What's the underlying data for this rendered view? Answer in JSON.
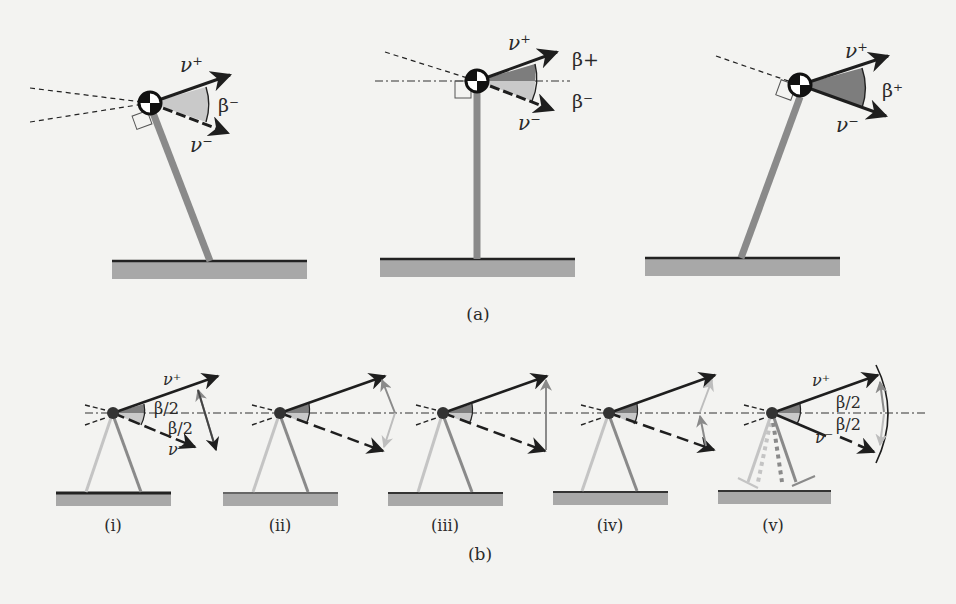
{
  "figure": {
    "panel_a": {
      "caption": "(a)",
      "subfigures": [
        {
          "id": "a-left",
          "v_plus": "ν⁺",
          "v_minus": "ν⁻",
          "angle_label": "β⁻"
        },
        {
          "id": "a-middle",
          "v_plus": "ν⁺",
          "v_minus": "ν⁻",
          "angle_label_upper": "β+",
          "angle_label_lower": "β⁻"
        },
        {
          "id": "a-right",
          "v_plus": "ν⁺",
          "v_minus": "ν⁻",
          "angle_label": "β⁺"
        }
      ]
    },
    "panel_b": {
      "caption": "(b)",
      "subfigures": [
        {
          "id": "b-i",
          "caption": "(i)",
          "v_plus": "ν⁺",
          "v_minus": "ν⁻",
          "angle_upper": "β/2",
          "angle_lower": "β/2"
        },
        {
          "id": "b-ii",
          "caption": "(ii)"
        },
        {
          "id": "b-iii",
          "caption": "(iii)"
        },
        {
          "id": "b-iv",
          "caption": "(iv)"
        },
        {
          "id": "b-v",
          "caption": "(v)",
          "v_plus": "ν⁺",
          "v_minus": "ν⁻",
          "angle_upper": "β/2",
          "angle_lower": "β/2"
        }
      ]
    },
    "colors": {
      "background": "#f3f3f1",
      "ink": "#1e1e1e",
      "leg": "#8a8a8a",
      "leg_light": "#c4c4c4",
      "ground": "#a8a8a8",
      "wedge_dark": "#7d7d7d",
      "wedge_light": "#c9c9c9"
    }
  }
}
